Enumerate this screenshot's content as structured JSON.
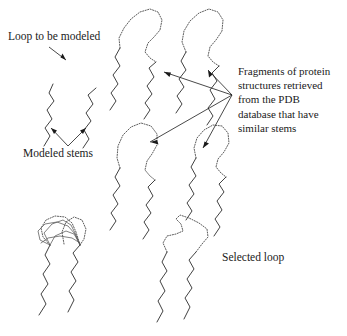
{
  "figure": {
    "background_color": "#ffffff",
    "ink_color": "#2b2b2b",
    "width": 347,
    "height": 336
  },
  "labels": {
    "loop_to_be_modeled": "Loop to be modeled",
    "modeled_stems": "Modeled stems",
    "selected_loop": "Selected loop",
    "fragments_lines": [
      "Fragments of protein",
      "structures retrieved",
      "from the PDB",
      "database that have",
      "similar stems"
    ]
  },
  "panels": {
    "query": {
      "name": "query-stems",
      "description": "Two modeled stem backbones with a gap where the loop must be built"
    },
    "fragment_library": {
      "name": "retrieved-fragments",
      "count": 4,
      "description": "Four PDB fragments, each a dotted loop joining two solid stems"
    },
    "superposition": {
      "name": "superposed-candidate-loops",
      "description": "Candidate loops superposed onto the modeled stems"
    },
    "result": {
      "name": "selected-loop-model",
      "description": "Final single loop selected and grafted between the stems"
    }
  }
}
